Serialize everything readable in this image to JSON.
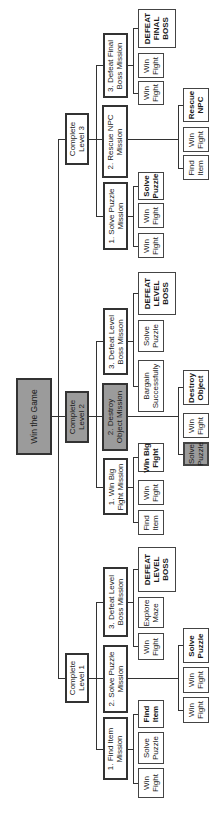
{
  "diagram": {
    "root": {
      "label": "Win the Game",
      "color": "#9b9b9b"
    },
    "levels": [
      {
        "label": "Complete\nLevel 1",
        "missions": [
          {
            "label": "1. Find Item\nMission",
            "tasks": [
              "Win\nFight",
              "Solve\nPuzzle",
              "Find\nItem"
            ]
          },
          {
            "label": "2. Solve Puzzle\nMission",
            "tasks": [
              "Win\nFight",
              "Win\nFight",
              "Solve\nPuzzle"
            ]
          },
          {
            "label": "3. Defeat Level\nBoss Mission",
            "tasks": [
              "Win\nFight",
              "Explore\nMaze",
              "DEFEAT\nLEVEL\nBOSS"
            ]
          }
        ]
      },
      {
        "label": "Complete\nLevel 2",
        "color": "#9b9b9b",
        "missions": [
          {
            "label": "1. Win Big\nFight Mission",
            "tasks": [
              "Find\nItem",
              "Win\nFight",
              "Win Big\nFight"
            ]
          },
          {
            "label": "2. Destroy\nObject Mission",
            "color": "#9b9b9b",
            "tasks": [
              "Solve\nPuzzle",
              "Win\nFight",
              "Destroy\nObject"
            ]
          },
          {
            "label": "3. Defeat Level\nBoss Misson",
            "tasks": [
              "Bargain\nSuccessfully",
              "Solve\nPuzzle",
              "DEFEAT\nLEVEL\nBOSS"
            ]
          }
        ]
      },
      {
        "label": "Complete\nLevel 3",
        "missions": [
          {
            "label": "1. Solve Puzzle\nMission",
            "tasks": [
              "Win\nFight",
              "Win\nFight",
              "Solve\nPuzzle"
            ]
          },
          {
            "label": "2. Rescue NPC\nMission",
            "tasks": [
              "Find\nItem",
              "Win\nFight",
              "Rescue\nNPC"
            ]
          },
          {
            "label": "3. Defeat Final\nBoss Mission",
            "tasks": [
              "Win\nFight",
              "Win\nFight",
              "DEFEAT\nFINAL\nBOSS"
            ]
          }
        ]
      }
    ]
  }
}
